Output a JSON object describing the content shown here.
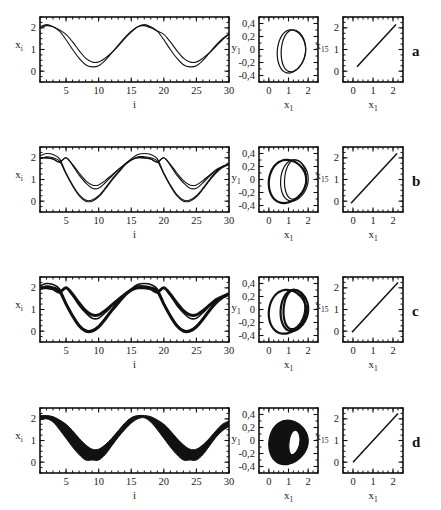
{
  "figure": {
    "rows": [
      {
        "letter": "a",
        "ts_style": "two-lines",
        "phase_style": "double-loop",
        "sync_style": "thin"
      },
      {
        "letter": "b",
        "ts_style": "four-lines",
        "phase_style": "triple-loop",
        "sync_style": "thin"
      },
      {
        "letter": "c",
        "ts_style": "four-lines-thick",
        "phase_style": "triple-loop-thick",
        "sync_style": "thin"
      },
      {
        "letter": "d",
        "ts_style": "band",
        "phase_style": "filled-ring",
        "sync_style": "thin"
      }
    ],
    "row_tops": [
      17,
      147,
      277,
      408
    ]
  },
  "chart_data": [
    {
      "type": "line",
      "panel": "time-series",
      "xlabel": "i",
      "ylabel": "x_i",
      "xlim": [
        1,
        30
      ],
      "ylim": [
        -0.5,
        2.5
      ],
      "xticks": [
        5,
        10,
        15,
        20,
        25,
        30
      ],
      "yticks": [
        0,
        1,
        2
      ],
      "description": "Spatial profile x_i vs site index i; wave with period ~15 sites, peaks ~2.1 at i≈2 and i≈17, minima ~0.2–0.5 at i≈9 and i≈24",
      "rows": {
        "a": {
          "series": [
            {
              "name": "upper",
              "x": [
                1,
                2,
                3,
                4,
                5,
                6,
                7,
                8,
                9,
                10,
                11,
                12,
                13,
                14,
                15,
                16,
                17,
                18,
                19,
                20,
                21,
                22,
                23,
                24,
                25,
                26,
                27,
                28,
                29,
                30
              ],
              "y": [
                2.0,
                2.1,
                2.05,
                1.9,
                1.7,
                1.35,
                0.95,
                0.6,
                0.42,
                0.42,
                0.6,
                0.85,
                1.15,
                1.5,
                1.8,
                2.05,
                2.1,
                2.0,
                1.85,
                1.7,
                1.35,
                0.95,
                0.6,
                0.42,
                0.42,
                0.6,
                0.85,
                1.15,
                1.45,
                1.7
              ]
            },
            {
              "name": "lower",
              "x": [
                1,
                2,
                3,
                4,
                5,
                6,
                7,
                8,
                9,
                10,
                11,
                12,
                13,
                14,
                15,
                16,
                17,
                18,
                19,
                20,
                21,
                22,
                23,
                24,
                25,
                26,
                27,
                28,
                29,
                30
              ],
              "y": [
                2.05,
                2.15,
                2.05,
                1.85,
                1.45,
                1.0,
                0.6,
                0.3,
                0.2,
                0.25,
                0.5,
                0.85,
                1.2,
                1.55,
                1.85,
                2.05,
                2.15,
                2.05,
                1.85,
                1.45,
                1.0,
                0.6,
                0.3,
                0.2,
                0.25,
                0.5,
                0.85,
                1.2,
                1.5,
                1.72
              ]
            }
          ]
        },
        "b": {
          "series": [
            {
              "name": "s1",
              "x": [
                1,
                2,
                3,
                4,
                5,
                6,
                7,
                8,
                9,
                10,
                11,
                12,
                13,
                14,
                15,
                16,
                17,
                18,
                19,
                20,
                21,
                22,
                23,
                24,
                25,
                26,
                27,
                28,
                29,
                30
              ],
              "y": [
                2.0,
                2.0,
                1.95,
                1.8,
                2.0,
                1.7,
                1.3,
                0.95,
                0.75,
                0.75,
                0.95,
                1.2,
                1.45,
                1.7,
                1.9,
                2.0,
                2.0,
                1.95,
                1.8,
                2.0,
                1.7,
                1.3,
                0.95,
                0.75,
                0.75,
                0.95,
                1.2,
                1.45,
                1.6,
                1.72
              ]
            },
            {
              "name": "s2",
              "x": [
                1,
                2,
                3,
                4,
                5,
                6,
                7,
                8,
                9,
                10,
                11,
                12,
                13,
                14,
                15,
                16,
                17,
                18,
                19,
                20,
                21,
                22,
                23,
                24,
                25,
                26,
                27,
                28,
                29,
                30
              ],
              "y": [
                2.0,
                2.0,
                1.95,
                1.8,
                2.0,
                1.65,
                1.2,
                0.85,
                0.6,
                0.6,
                0.85,
                1.15,
                1.45,
                1.7,
                1.9,
                2.0,
                2.0,
                1.95,
                1.8,
                2.0,
                1.65,
                1.2,
                0.85,
                0.6,
                0.6,
                0.85,
                1.15,
                1.4,
                1.6,
                1.7
              ]
            },
            {
              "name": "s3",
              "x": [
                1,
                2,
                3,
                4,
                5,
                6,
                7,
                8,
                9,
                10,
                11,
                12,
                13,
                14,
                15,
                16,
                17,
                18,
                19,
                20,
                21,
                22,
                23,
                24,
                25,
                26,
                27,
                28,
                29,
                30
              ],
              "y": [
                2.1,
                2.2,
                2.15,
                1.95,
                1.3,
                0.75,
                0.3,
                0.05,
                0.05,
                0.25,
                0.6,
                1.0,
                1.35,
                1.7,
                1.95,
                2.15,
                2.2,
                2.15,
                1.95,
                1.3,
                0.75,
                0.3,
                0.05,
                0.05,
                0.25,
                0.6,
                1.0,
                1.35,
                1.6,
                1.72
              ]
            },
            {
              "name": "s4",
              "x": [
                1,
                2,
                3,
                4,
                5,
                6,
                7,
                8,
                9,
                10,
                11,
                12,
                13,
                14,
                15,
                16,
                17,
                18,
                19,
                20,
                21,
                22,
                23,
                24,
                25,
                26,
                27,
                28,
                29,
                30
              ],
              "y": [
                1.95,
                2.05,
                2.0,
                1.85,
                1.25,
                0.7,
                0.25,
                0.0,
                0.0,
                0.2,
                0.55,
                0.95,
                1.3,
                1.65,
                1.9,
                2.05,
                2.05,
                2.0,
                1.85,
                1.25,
                0.7,
                0.25,
                0.0,
                0.0,
                0.2,
                0.55,
                0.95,
                1.3,
                1.55,
                1.7
              ]
            }
          ]
        },
        "c": {
          "series_same_as": "b",
          "note": "bundled thick trajectories"
        },
        "d": {
          "band": {
            "upper": [
              2.15,
              2.15,
              2.1,
              1.95,
              1.75,
              1.45,
              1.1,
              0.8,
              0.6,
              0.6,
              0.8,
              1.1,
              1.45,
              1.8,
              2.05,
              2.15,
              2.15,
              2.1,
              1.95,
              1.75,
              1.45,
              1.1,
              0.8,
              0.6,
              0.6,
              0.8,
              1.1,
              1.45,
              1.75,
              1.9
            ],
            "lower": [
              1.95,
              2.0,
              1.85,
              1.5,
              1.1,
              0.7,
              0.35,
              0.1,
              0.1,
              0.1,
              0.35,
              0.75,
              1.15,
              1.5,
              1.8,
              2.0,
              2.05,
              1.85,
              1.5,
              1.1,
              0.7,
              0.35,
              0.1,
              0.1,
              0.1,
              0.35,
              0.75,
              1.15,
              1.45,
              1.65
            ]
          }
        }
      }
    },
    {
      "type": "line",
      "panel": "phase-portrait",
      "xlabel": "x_1",
      "ylabel": "y_1",
      "xlim": [
        -0.5,
        2.5
      ],
      "ylim": [
        -0.5,
        0.5
      ],
      "xticks": [
        0,
        1,
        2
      ],
      "yticks": [
        -0.4,
        -0.2,
        0,
        0.2,
        0.4
      ],
      "ytick_labels": [
        "-0,4",
        "-0,2",
        "0",
        "0,2",
        "0,4"
      ],
      "description": "Closed limit-cycle loops in (x1, y1) plane; x from ~0 to ~2.1, y from ~-0.37 to ~0.32",
      "loops": {
        "a": [
          {
            "cx": 1.15,
            "rx": 0.72,
            "top": 0.3,
            "bot": -0.36,
            "shift": 0.2
          },
          {
            "cx": 1.25,
            "rx": 0.62,
            "top": 0.3,
            "bot": -0.34,
            "shift": 0.2
          }
        ],
        "b": [
          {
            "cx": 0.95,
            "rx": 0.95,
            "top": 0.3,
            "bot": -0.36,
            "shift": 0.25
          },
          {
            "cx": 1.35,
            "rx": 0.55,
            "top": 0.3,
            "bot": -0.3,
            "shift": 0.2
          },
          {
            "cx": 1.3,
            "rx": 0.7,
            "top": 0.3,
            "bot": -0.33,
            "shift": 0.2
          }
        ],
        "c": [
          {
            "cx": 0.95,
            "rx": 0.95,
            "top": 0.3,
            "bot": -0.37,
            "shift": 0.25
          },
          {
            "cx": 1.3,
            "rx": 0.55,
            "top": 0.3,
            "bot": -0.3,
            "shift": 0.2
          },
          {
            "cx": 1.3,
            "rx": 0.7,
            "top": 0.3,
            "bot": -0.33,
            "shift": 0.2
          }
        ],
        "d": [
          {
            "cx": 1.0,
            "rx": 1.0,
            "top": 0.31,
            "bot": -0.37,
            "shift": 0.25,
            "filled_inner_rx": 0.5
          }
        ]
      }
    },
    {
      "type": "line",
      "panel": "synchronization",
      "xlabel": "x_1",
      "ylabel": "x_15",
      "xlim": [
        -0.5,
        2.5
      ],
      "ylim": [
        -0.5,
        2.5
      ],
      "xticks": [
        0,
        1,
        2
      ],
      "yticks": [
        0,
        1,
        2
      ],
      "description": "Diagonal line x15 = x1 indicating synchronization",
      "segments": {
        "a": [
          [
            0.2,
            0.2
          ],
          [
            2.15,
            2.15
          ]
        ],
        "b": [
          [
            -0.1,
            -0.1
          ],
          [
            2.2,
            2.2
          ]
        ],
        "c": [
          [
            -0.05,
            -0.05
          ],
          [
            2.25,
            2.25
          ]
        ],
        "d": [
          [
            0.0,
            0.0
          ],
          [
            2.25,
            2.25
          ]
        ]
      }
    }
  ],
  "labels": {
    "ts_xlabel": "i",
    "ts_ylabel_main": "x",
    "ts_ylabel_sub": "i",
    "pp_xlabel_main": "x",
    "pp_xlabel_sub": "1",
    "pp_ylabel_main": "y",
    "pp_ylabel_sub": "1",
    "sync_xlabel_main": "x",
    "sync_xlabel_sub": "1",
    "sync_ylabel_main": "x",
    "sync_ylabel_sub": "15"
  }
}
